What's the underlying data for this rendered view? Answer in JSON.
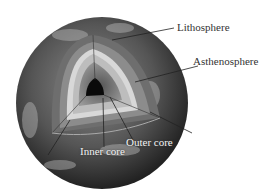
{
  "diagram": {
    "labels": {
      "lithosphere": "Lithosphere",
      "asthenosphere": "Asthenosphere",
      "outer_core": "Outer core",
      "inner_core": "Inner core"
    },
    "colors": {
      "globe": "#4a4a4a",
      "lithosphere": "#7a7a7a",
      "asthenosphere": "#9a9a9a",
      "mantle": "#d4d4d4",
      "outer_core": "#8a8a8a",
      "inner_core": "#0a0a0a",
      "label_text": "#333333"
    }
  }
}
